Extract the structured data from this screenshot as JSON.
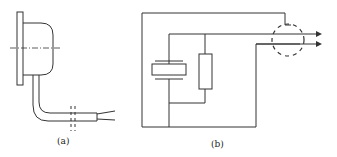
{
  "figure": {
    "panels": [
      {
        "id": "a",
        "caption": "(a)",
        "description": "Sensor housing side view with mounting flange, dome body, center line, bent cable and break marks"
      },
      {
        "id": "b",
        "caption": "(b)",
        "description": "Equivalent circuit: crystal element in parallel with resistor, outer shield loop, two output leads through dashed shield circle with arrows"
      }
    ],
    "colors": {
      "line": "#333333",
      "background": "#ffffff"
    }
  }
}
